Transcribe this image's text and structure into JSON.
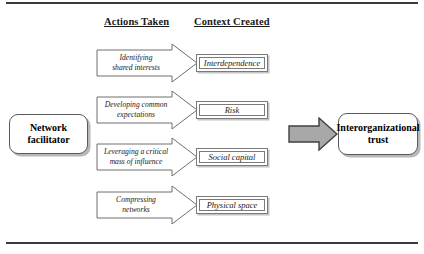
{
  "figure": {
    "headers": {
      "actions": "Actions Taken",
      "context": "Context Created"
    },
    "source_box": {
      "label": "Network facilitator",
      "line1": "Network",
      "line2": "facilitator"
    },
    "outcome_box": {
      "label": "Interorganizational trust",
      "line1": "Interorganizational",
      "line2": "trust"
    },
    "rows": [
      {
        "action_line1": "Identifying",
        "action_line2": "shared interests",
        "action": "Identifying shared interests",
        "context": "Interdependence"
      },
      {
        "action_line1": "Developing common",
        "action_line2": "expectations",
        "action": "Developing common expectations",
        "context": "Risk"
      },
      {
        "action_line1": "Leveraging a critical",
        "action_line2": "mass of influence",
        "action": "Leveraging a critical mass of influence",
        "context": "Social capital"
      },
      {
        "action_line1": "Compressing",
        "action_line2": "networks",
        "action": "Compressing networks",
        "context": "Physical space"
      }
    ],
    "colors": {
      "rule": "#3a3a3a",
      "box_border": "#5a5a5a",
      "box_shadow": "#b8b8b8",
      "arrow_outline": "#6e6e6e",
      "connector_fill": "#a8a8a8",
      "connector_outline": "#404040",
      "text": "#1a1a1a",
      "background": "#ffffff"
    }
  }
}
